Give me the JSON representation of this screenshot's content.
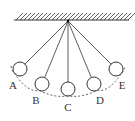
{
  "diagram": {
    "support": {
      "x1": 14,
      "x2": 129,
      "y": 20,
      "hatch_top": 13
    },
    "pivot": {
      "x": 68,
      "y": 21
    },
    "ball_radius": 7,
    "balls": [
      {
        "label": "A",
        "cx": 20,
        "cy": 69,
        "lx": 13,
        "ly": 89
      },
      {
        "label": "B",
        "cx": 42,
        "cy": 84,
        "lx": 36,
        "ly": 104
      },
      {
        "label": "C",
        "cx": 68,
        "cy": 89,
        "lx": 68,
        "ly": 111
      },
      {
        "label": "D",
        "cx": 94,
        "cy": 84,
        "lx": 100,
        "ly": 104
      },
      {
        "label": "E",
        "cx": 116,
        "cy": 69,
        "lx": 122,
        "ly": 89
      }
    ],
    "line_color": "#333333",
    "arc": "dashed"
  }
}
